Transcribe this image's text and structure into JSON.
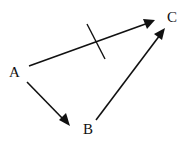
{
  "diagram": {
    "nodes": [
      {
        "id": "A",
        "label": "A",
        "x": 14,
        "y": 77
      },
      {
        "id": "B",
        "label": "B",
        "x": 88,
        "y": 133
      },
      {
        "id": "C",
        "label": "C",
        "x": 172,
        "y": 22
      }
    ],
    "edges": [
      {
        "from": "A",
        "to": "C",
        "crossed_out": true
      },
      {
        "from": "A",
        "to": "B",
        "crossed_out": false
      },
      {
        "from": "B",
        "to": "C",
        "crossed_out": false
      }
    ],
    "colors": {
      "stroke": "#111111",
      "background": "#ffffff"
    }
  }
}
